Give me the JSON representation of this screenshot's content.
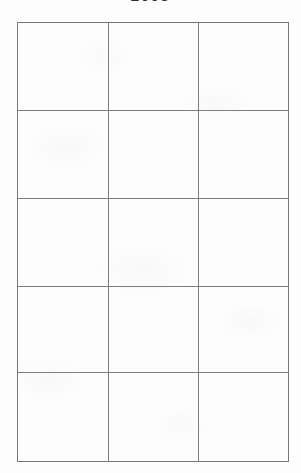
{
  "document": {
    "title_clipped": "2008",
    "page_background": "#fdfdfd",
    "ink_color": "#7e7e82",
    "title_color": "#2c2c2e"
  },
  "table": {
    "name": "empty-grid-table",
    "columns": 3,
    "rows": 5,
    "has_header": false,
    "column_headers": [
      "",
      "",
      ""
    ],
    "cells": [
      [
        "",
        "",
        ""
      ],
      [
        "",
        "",
        ""
      ],
      [
        "",
        "",
        ""
      ],
      [
        "",
        "",
        ""
      ],
      [
        "",
        "",
        ""
      ]
    ],
    "geometry": {
      "left": 17,
      "top": 22,
      "right": 285,
      "bottom": 461,
      "column_dividers_x": [
        107,
        196
      ],
      "row_dividers_y": [
        110,
        198,
        286,
        372
      ]
    }
  }
}
